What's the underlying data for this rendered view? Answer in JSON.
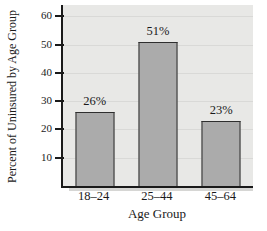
{
  "chart_data": {
    "type": "bar",
    "title": "",
    "categories": [
      "18–24",
      "25–44",
      "45–64"
    ],
    "values": [
      26,
      51,
      23
    ],
    "value_labels": [
      "26%",
      "51%",
      "23%"
    ],
    "xlabel": "Age Group",
    "ylabel": "Percent of Uninsured by Age Group",
    "yticks": [
      10,
      20,
      30,
      40,
      50,
      60
    ],
    "ylim": [
      0,
      64
    ],
    "grid": true,
    "legend": null,
    "colors": {
      "bar_fill": "#ababab",
      "bar_border": "#2e2e2e",
      "plot_bg": "#e8e8e6",
      "gridline": "#d9d9d7",
      "axis": "#1a1a1a",
      "text": "#1a1a1a"
    }
  }
}
